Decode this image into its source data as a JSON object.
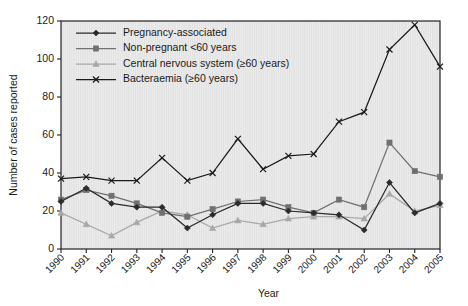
{
  "chart_data": {
    "type": "line",
    "title": "",
    "xlabel": "Year",
    "ylabel": "Number of cases reported",
    "categories": [
      "1990",
      "1991",
      "1992",
      "1993",
      "1994",
      "1995",
      "1996",
      "1997",
      "1998",
      "1999",
      "2000",
      "2001",
      "2002",
      "2003",
      "2004",
      "2005"
    ],
    "xlim": [
      1990,
      2005
    ],
    "ylim": [
      0,
      120
    ],
    "yticks": [
      0,
      20,
      40,
      60,
      80,
      100,
      120
    ],
    "grid": "vertical",
    "legend_position": "top-left",
    "series": [
      {
        "name": "Pregnancy-associated",
        "color": "#2b2b2b",
        "marker": "diamond",
        "values": [
          25,
          32,
          24,
          22,
          22,
          11,
          18,
          24,
          24,
          20,
          19,
          18,
          10,
          35,
          19,
          24
        ]
      },
      {
        "name": "Non-pregnant <60 years",
        "color": "#707070",
        "marker": "square",
        "values": [
          26,
          31,
          28,
          24,
          19,
          17,
          21,
          25,
          26,
          22,
          19,
          26,
          22,
          56,
          41,
          38
        ]
      },
      {
        "name": "Central nervous system (≥60 years)",
        "color": "#a8a8a8",
        "marker": "triangle",
        "values": [
          19,
          13,
          7,
          14,
          20,
          18,
          11,
          15,
          13,
          16,
          17,
          17,
          16,
          29,
          20,
          23
        ]
      },
      {
        "name": "Bacteraemia (≥60 years)",
        "color": "#1a1a1a",
        "marker": "cross",
        "values": [
          37,
          38,
          36,
          36,
          48,
          36,
          40,
          58,
          42,
          49,
          50,
          67,
          72,
          105,
          118,
          96
        ]
      }
    ]
  },
  "axes": {
    "ylabel": "Number of cases reported",
    "xlabel": "Year"
  }
}
